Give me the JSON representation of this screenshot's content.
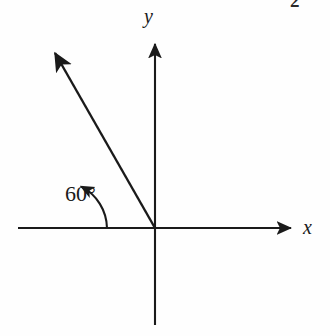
{
  "figure": {
    "type": "angle-in-standard-position-diagram",
    "background_color": "#fefefe",
    "stroke_color": "#1a1a1a",
    "width": 330,
    "height": 336,
    "corner_number": "2"
  },
  "labels": {
    "y_axis": "y",
    "x_axis": "x",
    "angle": "60°"
  },
  "chart_data": {
    "type": "scatter",
    "title": "",
    "xlabel": "x",
    "ylabel": "y",
    "grid": false,
    "legend": null,
    "origin_px": [
      155,
      228
    ],
    "annotations": [
      {
        "name": "terminal-ray",
        "label": "60°",
        "angle_degrees": 60,
        "from_px": [
          155,
          228
        ],
        "to_px": [
          50,
          45
        ],
        "arrow": "end"
      },
      {
        "name": "angle-arc",
        "start_angle_degrees": 0,
        "end_angle_degrees": 60,
        "radius_px": 48,
        "arrow": "end"
      }
    ],
    "axes": {
      "x_axis_px": {
        "from": [
          18,
          228
        ],
        "to": [
          297,
          228
        ],
        "arrow": "end"
      },
      "y_axis_px": {
        "from": [
          155,
          325
        ],
        "to": [
          155,
          38
        ],
        "arrow": "end"
      }
    }
  }
}
